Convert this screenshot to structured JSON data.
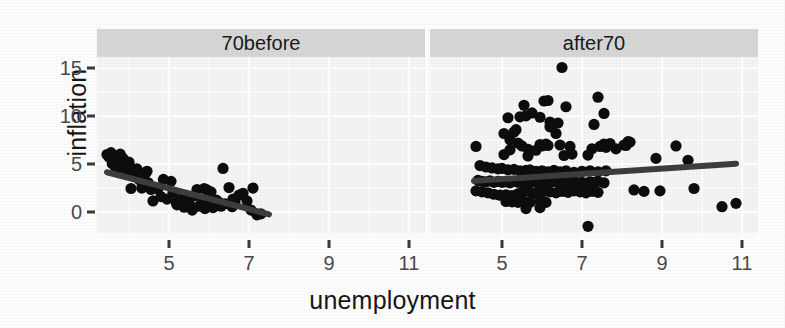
{
  "chart_data": {
    "type": "scatter",
    "title": "",
    "xlabel": "unemployment",
    "ylabel": "inflation",
    "grid": true,
    "legend": "none",
    "facet_variable": "period",
    "xlim": [
      3.2,
      11.4
    ],
    "ylim": [
      -2.2,
      16.2
    ],
    "xticks": [
      5,
      7,
      9,
      11
    ],
    "yticks": [
      0,
      5,
      10,
      15
    ],
    "xtick_labels": [
      "5",
      "7",
      "9",
      "11"
    ],
    "ytick_labels": [
      "0",
      "5",
      "10",
      "15"
    ],
    "panels": [
      {
        "label": "70before",
        "fit": {
          "type": "linear",
          "x0": 3.45,
          "y0": 4.15,
          "x1": 7.5,
          "y1": -0.25
        },
        "points": [
          [
            3.45,
            6.0
          ],
          [
            3.5,
            5.75
          ],
          [
            3.55,
            6.2
          ],
          [
            3.62,
            5.5
          ],
          [
            3.58,
            5.05
          ],
          [
            3.66,
            4.7
          ],
          [
            3.72,
            5.35
          ],
          [
            3.78,
            6.05
          ],
          [
            3.85,
            5.6
          ],
          [
            3.9,
            4.95
          ],
          [
            3.95,
            4.35
          ],
          [
            4.0,
            5.2
          ],
          [
            4.05,
            4.6
          ],
          [
            4.12,
            3.9
          ],
          [
            4.2,
            4.5
          ],
          [
            4.26,
            3.35
          ],
          [
            4.32,
            2.5
          ],
          [
            4.4,
            3.95
          ],
          [
            4.48,
            3.05
          ],
          [
            4.55,
            2.35
          ],
          [
            4.6,
            1.15
          ],
          [
            4.72,
            2.4
          ],
          [
            4.8,
            1.6
          ],
          [
            4.86,
            3.4
          ],
          [
            4.95,
            1.35
          ],
          [
            5.05,
            3.2
          ],
          [
            5.1,
            2.05
          ],
          [
            5.18,
            1.0
          ],
          [
            5.25,
            0.85
          ],
          [
            5.3,
            1.35
          ],
          [
            5.38,
            0.5
          ],
          [
            5.45,
            1.5
          ],
          [
            5.5,
            0.95
          ],
          [
            5.58,
            0.2
          ],
          [
            5.62,
            1.7
          ],
          [
            5.7,
            2.35
          ],
          [
            5.75,
            0.6
          ],
          [
            5.82,
            1.1
          ],
          [
            5.88,
            2.45
          ],
          [
            5.95,
            2.3
          ],
          [
            6.0,
            0.9
          ],
          [
            6.05,
            2.1
          ],
          [
            6.1,
            0.45
          ],
          [
            6.18,
            1.25
          ],
          [
            6.25,
            1.0
          ],
          [
            6.3,
            0.6
          ],
          [
            6.35,
            4.55
          ],
          [
            6.4,
            0.85
          ],
          [
            6.5,
            2.55
          ],
          [
            6.58,
            0.55
          ],
          [
            6.65,
            0.95
          ],
          [
            6.75,
            1.75
          ],
          [
            6.85,
            1.95
          ],
          [
            6.95,
            1.15
          ],
          [
            7.05,
            0.2
          ],
          [
            7.1,
            2.5
          ],
          [
            7.2,
            -0.3
          ],
          [
            7.3,
            -0.2
          ],
          [
            4.45,
            4.25
          ],
          [
            4.05,
            2.45
          ],
          [
            5.2,
            0.75
          ],
          [
            5.9,
            0.35
          ],
          [
            6.6,
            1.35
          ],
          [
            3.52,
            5.9
          ],
          [
            3.7,
            4.4
          ]
        ]
      },
      {
        "label": "after70",
        "fit": {
          "type": "linear",
          "x0": 4.3,
          "y0": 3.25,
          "x1": 10.85,
          "y1": 5.05
        },
        "points": [
          [
            6.5,
            15.1
          ],
          [
            7.4,
            12.0
          ],
          [
            6.05,
            11.6
          ],
          [
            6.15,
            11.65
          ],
          [
            5.55,
            11.15
          ],
          [
            6.6,
            11.0
          ],
          [
            5.75,
            10.35
          ],
          [
            7.55,
            10.3
          ],
          [
            5.6,
            10.05
          ],
          [
            5.95,
            9.9
          ],
          [
            6.2,
            9.4
          ],
          [
            6.25,
            9.1
          ],
          [
            5.15,
            9.85
          ],
          [
            5.45,
            9.95
          ],
          [
            5.35,
            8.6
          ],
          [
            5.3,
            8.35
          ],
          [
            6.35,
            8.2
          ],
          [
            5.2,
            7.55
          ],
          [
            5.4,
            7.2
          ],
          [
            5.95,
            7.05
          ],
          [
            6.1,
            7.1
          ],
          [
            6.45,
            7.0
          ],
          [
            7.55,
            7.1
          ],
          [
            7.7,
            7.15
          ],
          [
            7.6,
            6.75
          ],
          [
            8.1,
            6.95
          ],
          [
            8.15,
            7.35
          ],
          [
            8.2,
            7.3
          ],
          [
            9.35,
            6.9
          ],
          [
            4.35,
            6.85
          ],
          [
            5.2,
            6.5
          ],
          [
            5.5,
            6.9
          ],
          [
            5.65,
            6.55
          ],
          [
            5.85,
            6.45
          ],
          [
            6.0,
            6.9
          ],
          [
            6.15,
            6.95
          ],
          [
            6.7,
            6.85
          ],
          [
            7.25,
            6.6
          ],
          [
            7.45,
            6.85
          ],
          [
            7.85,
            6.6
          ],
          [
            5.05,
            6.0
          ],
          [
            5.65,
            5.85
          ],
          [
            6.55,
            5.9
          ],
          [
            6.75,
            6.05
          ],
          [
            7.15,
            5.95
          ],
          [
            8.85,
            5.6
          ],
          [
            9.65,
            5.4
          ],
          [
            4.45,
            4.85
          ],
          [
            4.6,
            4.7
          ],
          [
            4.75,
            4.6
          ],
          [
            4.9,
            4.5
          ],
          [
            5.0,
            4.55
          ],
          [
            5.15,
            4.4
          ],
          [
            5.3,
            4.45
          ],
          [
            5.45,
            4.3
          ],
          [
            5.6,
            4.35
          ],
          [
            5.7,
            4.4
          ],
          [
            5.85,
            4.25
          ],
          [
            6.0,
            4.3
          ],
          [
            6.15,
            4.2
          ],
          [
            6.3,
            4.35
          ],
          [
            6.45,
            4.2
          ],
          [
            6.6,
            4.3
          ],
          [
            6.8,
            4.15
          ],
          [
            7.0,
            4.25
          ],
          [
            7.2,
            4.3
          ],
          [
            7.4,
            4.2
          ],
          [
            7.6,
            4.3
          ],
          [
            4.4,
            3.3
          ],
          [
            4.5,
            3.2
          ],
          [
            4.6,
            3.15
          ],
          [
            4.7,
            3.25
          ],
          [
            4.8,
            3.1
          ],
          [
            4.9,
            3.2
          ],
          [
            5.0,
            3.1
          ],
          [
            5.1,
            3.15
          ],
          [
            5.2,
            3.05
          ],
          [
            5.3,
            3.2
          ],
          [
            5.4,
            3.1
          ],
          [
            5.5,
            3.15
          ],
          [
            5.6,
            3.0
          ],
          [
            5.7,
            3.1
          ],
          [
            5.8,
            3.2
          ],
          [
            5.9,
            3.05
          ],
          [
            6.0,
            3.15
          ],
          [
            6.1,
            3.0
          ],
          [
            6.2,
            3.1
          ],
          [
            6.3,
            3.2
          ],
          [
            6.4,
            3.05
          ],
          [
            6.5,
            3.1
          ],
          [
            6.6,
            3.0
          ],
          [
            6.7,
            3.15
          ],
          [
            6.8,
            3.2
          ],
          [
            6.9,
            3.05
          ],
          [
            7.0,
            3.1
          ],
          [
            7.1,
            3.0
          ],
          [
            7.2,
            3.15
          ],
          [
            7.3,
            3.1
          ],
          [
            7.4,
            3.2
          ],
          [
            7.55,
            3.05
          ],
          [
            4.35,
            2.2
          ],
          [
            4.5,
            2.1
          ],
          [
            4.65,
            2.0
          ],
          [
            4.8,
            1.85
          ],
          [
            4.95,
            1.75
          ],
          [
            5.1,
            1.8
          ],
          [
            5.25,
            1.7
          ],
          [
            5.4,
            1.9
          ],
          [
            5.5,
            2.05
          ],
          [
            5.6,
            2.2
          ],
          [
            5.7,
            2.1
          ],
          [
            5.8,
            1.95
          ],
          [
            5.9,
            2.15
          ],
          [
            6.0,
            2.05
          ],
          [
            6.1,
            2.2
          ],
          [
            6.2,
            2.1
          ],
          [
            6.35,
            2.0
          ],
          [
            6.5,
            2.15
          ],
          [
            6.65,
            2.05
          ],
          [
            6.8,
            2.2
          ],
          [
            6.95,
            2.1
          ],
          [
            7.1,
            2.0
          ],
          [
            7.25,
            2.15
          ],
          [
            7.4,
            2.05
          ],
          [
            8.3,
            2.3
          ],
          [
            8.55,
            2.15
          ],
          [
            8.95,
            2.2
          ],
          [
            9.8,
            2.45
          ],
          [
            5.1,
            1.1
          ],
          [
            5.25,
            1.05
          ],
          [
            5.4,
            1.0
          ],
          [
            5.55,
            1.1
          ],
          [
            5.7,
            1.0
          ],
          [
            5.95,
            1.15
          ],
          [
            6.1,
            1.0
          ],
          [
            5.6,
            0.35
          ],
          [
            5.95,
            0.45
          ],
          [
            10.5,
            0.55
          ],
          [
            10.85,
            0.9
          ],
          [
            7.15,
            -1.5
          ],
          [
            6.2,
            8.9
          ],
          [
            6.4,
            9.3
          ],
          [
            5.05,
            8.2
          ],
          [
            7.3,
            9.15
          ],
          [
            8.05,
            7.0
          ]
        ]
      }
    ]
  }
}
